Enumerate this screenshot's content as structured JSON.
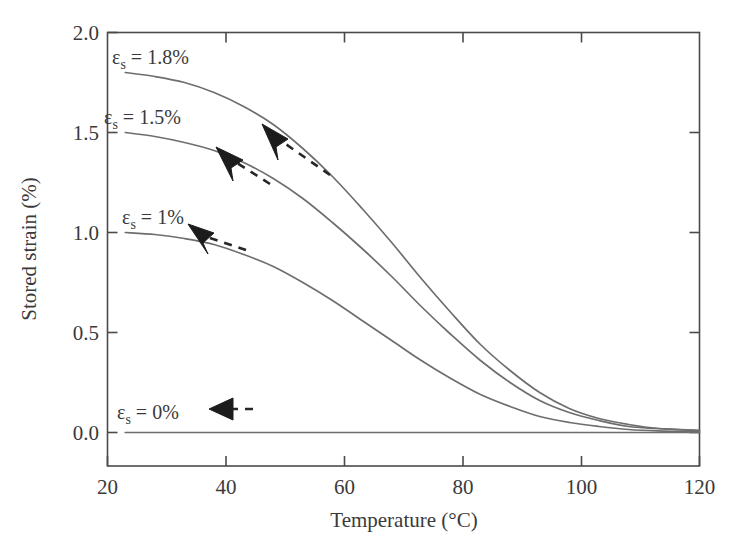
{
  "chart_data": {
    "type": "line",
    "title": "",
    "xlabel": "Temperature (°C)",
    "ylabel": "Stored strain (%)",
    "xlim": [
      20,
      120
    ],
    "ylim": [
      0.0,
      2.0
    ],
    "xticks": [
      20,
      40,
      60,
      80,
      100,
      120
    ],
    "xtick_labels": [
      "20",
      "40",
      "60",
      "80",
      "100",
      "120"
    ],
    "yticks": [
      0.0,
      0.5,
      1.0,
      1.5,
      2.0
    ],
    "ytick_labels": [
      "0.0",
      "0.5",
      "1.0",
      "1.5",
      "2.0"
    ],
    "grid": false,
    "legend": "inline annotations",
    "x": [
      23,
      28,
      33,
      38,
      43,
      48,
      53,
      58,
      63,
      68,
      73,
      78,
      83,
      88,
      93,
      98,
      103,
      108,
      113,
      120
    ],
    "series": [
      {
        "name": "εs = 1.8%",
        "label": "1.8%",
        "values": [
          1.8,
          1.78,
          1.75,
          1.7,
          1.63,
          1.54,
          1.42,
          1.28,
          1.12,
          0.95,
          0.77,
          0.6,
          0.44,
          0.31,
          0.2,
          0.12,
          0.07,
          0.04,
          0.02,
          0.01
        ]
      },
      {
        "name": "εs = 1.5%",
        "label": "1.5%",
        "values": [
          1.5,
          1.48,
          1.45,
          1.41,
          1.35,
          1.27,
          1.17,
          1.05,
          0.92,
          0.78,
          0.63,
          0.49,
          0.36,
          0.25,
          0.16,
          0.1,
          0.06,
          0.03,
          0.02,
          0.01
        ]
      },
      {
        "name": "εs = 1%",
        "label": "1%",
        "values": [
          1.0,
          0.99,
          0.97,
          0.94,
          0.89,
          0.83,
          0.75,
          0.66,
          0.56,
          0.46,
          0.36,
          0.27,
          0.19,
          0.13,
          0.08,
          0.05,
          0.03,
          0.015,
          0.008,
          0.004
        ]
      },
      {
        "name": "εs = 0%",
        "label": "0%",
        "values": [
          0.0,
          0.0,
          0.0,
          0.0,
          0.0,
          0.0,
          0.0,
          0.0,
          0.0,
          0.0,
          0.0,
          0.0,
          0.0,
          0.0,
          0.0,
          0.0,
          0.0,
          0.0,
          0.0,
          0.0
        ]
      }
    ],
    "annotations": [
      {
        "name": "curve-label-18",
        "symbol": "ε",
        "sub": "s",
        "text": " = 1.8%"
      },
      {
        "name": "curve-label-15",
        "symbol": "ε",
        "sub": "s",
        "text": " = 1.5%"
      },
      {
        "name": "curve-label-1",
        "symbol": "ε",
        "sub": "s",
        "text": " = 1%"
      },
      {
        "name": "curve-label-0",
        "symbol": "ε",
        "sub": "s",
        "text": " = 0%"
      }
    ],
    "arrows": [
      {
        "name": "arrow-18",
        "direction": "up-left",
        "note": "dashed arrow pointing toward 1.8% curve"
      },
      {
        "name": "arrow-15",
        "direction": "up-left",
        "note": "dashed arrow pointing toward 1.5% curve"
      },
      {
        "name": "arrow-1",
        "direction": "up-left",
        "note": "dashed arrow pointing toward 1% curve"
      },
      {
        "name": "arrow-0",
        "direction": "left",
        "note": "dashed arrow pointing toward 0% line"
      }
    ],
    "colors": {
      "curve": "#6e6e6e",
      "axis": "#4a4a4a",
      "text": "#3a3a3a",
      "arrow": "#1c1c1c",
      "background": "#ffffff"
    }
  }
}
